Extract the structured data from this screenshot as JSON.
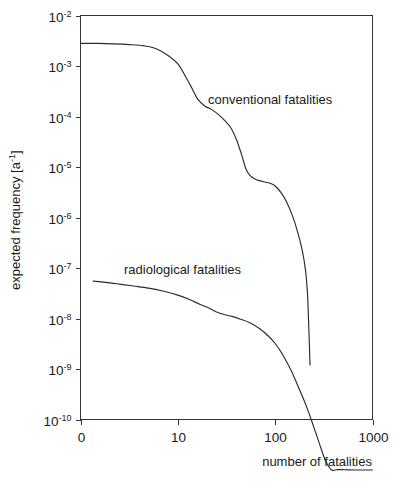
{
  "chart_data": {
    "type": "line",
    "title": "",
    "xlabel": "number of fatalities",
    "ylabel": "expected frequency [a-1]",
    "ylabel_base": "expected frequency [a",
    "ylabel_exp": "-1",
    "ylabel_tail": "]",
    "xscale": "log",
    "yscale": "log",
    "xlim": [
      1,
      1000
    ],
    "ylim": [
      1e-10,
      0.01
    ],
    "grid": false,
    "legend_position": "inline-annotations",
    "xticks": [
      {
        "label": "0",
        "value": 1
      },
      {
        "label": "10",
        "value": 10
      },
      {
        "label": "100",
        "value": 100
      },
      {
        "label": "1000",
        "value": 1000
      }
    ],
    "yticks": [
      {
        "mantissa": "10",
        "exponent": "-2",
        "value": 0.01
      },
      {
        "mantissa": "10",
        "exponent": "-3",
        "value": 0.001
      },
      {
        "mantissa": "10",
        "exponent": "-4",
        "value": 0.0001
      },
      {
        "mantissa": "10",
        "exponent": "-5",
        "value": 1e-05
      },
      {
        "mantissa": "10",
        "exponent": "-6",
        "value": 1e-06
      },
      {
        "mantissa": "10",
        "exponent": "-7",
        "value": 1e-07
      },
      {
        "mantissa": "10",
        "exponent": "-8",
        "value": 1e-08
      },
      {
        "mantissa": "10",
        "exponent": "-9",
        "value": 1e-09
      },
      {
        "mantissa": "10",
        "exponent": "-10",
        "value": 1e-10
      }
    ],
    "series": [
      {
        "name": "conventional fatalities",
        "label": "conventional fatalities",
        "x": [
          1.0,
          1.5,
          2.2,
          3.2,
          4.5,
          6.0,
          8.0,
          10.0,
          12.0,
          14.0,
          16.0,
          19.0,
          22.0,
          26.0,
          30.0,
          35.0,
          40.0,
          45.0,
          50.0,
          55.0,
          62.0,
          70.0,
          80.0,
          90.0,
          100.0,
          115.0,
          130.0,
          150.0,
          170.0,
          190.0,
          205.0,
          215.0,
          222.0,
          228.0
        ],
        "y": [
          0.0028,
          0.0028,
          0.00275,
          0.00265,
          0.0025,
          0.0022,
          0.0016,
          0.0011,
          0.00062,
          0.00036,
          0.00022,
          0.00016,
          0.00014,
          0.00011,
          8.5e-05,
          6e-05,
          3.5e-05,
          1.8e-05,
          9.2e-06,
          6.8e-06,
          5.8e-06,
          5.3e-06,
          5e-06,
          4.7e-06,
          4.2e-06,
          3.1e-06,
          2.1e-06,
          1.1e-06,
          5.2e-07,
          2.2e-07,
          9e-08,
          3e-08,
          6e-09,
          1.2e-09
        ]
      },
      {
        "name": "radiological fatalities",
        "label": "radiological fatalities",
        "x": [
          1.35,
          1.8,
          2.5,
          3.5,
          5.0,
          7.0,
          10.0,
          13.0,
          17.0,
          21.0,
          25.0,
          30.0,
          36.0,
          44.0,
          55.0,
          70.0,
          85.0,
          100.0,
          120.0,
          145.0,
          175.0,
          210.0,
          250.0,
          290.0,
          330.0,
          380.0,
          440.0,
          520.0,
          650.0,
          850.0,
          1000.0
        ],
        "y": [
          5.5e-08,
          5.2e-08,
          4.8e-08,
          4.4e-08,
          4e-08,
          3.5e-08,
          2.9e-08,
          2.4e-08,
          1.9e-08,
          1.6e-08,
          1.35e-08,
          1.2e-08,
          1.1e-08,
          9.7e-09,
          8.2e-09,
          6.2e-09,
          4.5e-09,
          3.2e-09,
          1.9e-09,
          9.5e-10,
          4.2e-10,
          1.8e-10,
          7e-11,
          3e-11,
          1.5e-11,
          1e-11,
          1.02e-11,
          1.01e-11,
          1e-11,
          1e-11,
          1e-11
        ]
      }
    ],
    "annotations": [
      {
        "text": "conventional fatalities",
        "x_px": 208,
        "y_px": 104
      },
      {
        "text": "radiological fatalities",
        "x_px": 124,
        "y_px": 274
      }
    ]
  }
}
